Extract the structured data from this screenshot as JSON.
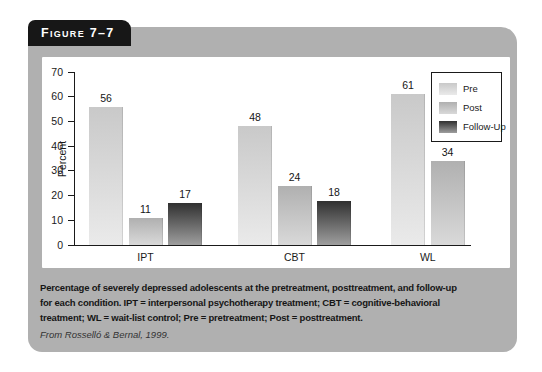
{
  "figure": {
    "label": "Figure 7–7"
  },
  "chart_data": {
    "type": "bar",
    "categories": [
      "IPT",
      "CBT",
      "WL"
    ],
    "series": [
      {
        "name": "Pre",
        "values": [
          56,
          48,
          61
        ]
      },
      {
        "name": "Post",
        "values": [
          11,
          24,
          34
        ]
      },
      {
        "name": "Follow-Up",
        "values": [
          17,
          18,
          null
        ]
      }
    ],
    "ylabel": "Percent",
    "xlabel": "",
    "ylim": [
      0,
      70
    ],
    "ytick_step": 10,
    "grid": false,
    "legend_position": "top-right",
    "bar_colors": {
      "Pre": [
        "#c9c9c9",
        "#eaeaea"
      ],
      "Post": [
        "#b0b0b0",
        "#d9d9d9"
      ],
      "Follow-Up": [
        "#303030",
        "#9e9e9e"
      ]
    }
  },
  "caption": {
    "lines": [
      "Percentage of severely depressed adolescents at the pretreatment, posttreatment, and follow-up",
      "for each condition. IPT = interpersonal psychotherapy treatment; CBT = cognitive-behavioral",
      "treatment; WL = wait-list control; Pre = pretreatment; Post = posttreatment."
    ],
    "credit": "From Rosselló & Bernal, 1999."
  },
  "colors": {
    "panel": "#b0b0b0",
    "tab": "#171717",
    "chart_background": "#ffffff",
    "axis": "#1a1a1a",
    "caption_text": "#161616"
  }
}
